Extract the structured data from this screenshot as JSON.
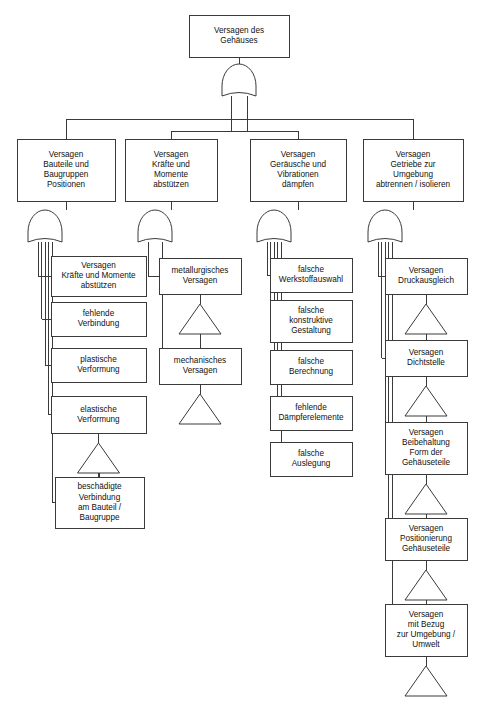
{
  "diagram": {
    "type": "fault-tree",
    "language": "de",
    "colors": {
      "stroke": "#3a3a3a",
      "fill": "#ffffff",
      "text": "#111111"
    },
    "gate_symbol": "or-gate",
    "transfer_symbol": "triangle"
  },
  "root": {
    "label": "Versagen des Gehäuses",
    "lines": [
      "Versagen des",
      "Gehäuses"
    ],
    "box": {
      "x": 189,
      "y": 15,
      "w": 100,
      "h": 42
    },
    "gate": {
      "cx": 239,
      "cy": 86
    }
  },
  "level2": [
    {
      "id": "col1-head",
      "label": "Versagen Bauteile und Baugruppen Positionen",
      "lines": [
        "Versagen",
        "Bauteile und",
        "Baugruppen",
        "Positionen"
      ],
      "box": {
        "x": 17,
        "y": 139,
        "w": 98,
        "h": 62
      },
      "gate": {
        "cx": 45,
        "cy": 232
      }
    },
    {
      "id": "col2-head",
      "label": "Versagen Kräfte und Momente abstützen",
      "lines": [
        "Versagen",
        "Kräfte und",
        "Momente",
        "abstützen"
      ],
      "box": {
        "x": 125,
        "y": 139,
        "w": 92,
        "h": 62
      },
      "gate": {
        "cx": 155,
        "cy": 232
      }
    },
    {
      "id": "col3-head",
      "label": "Versagen Geräusche und Vibrationen dämpfen",
      "lines": [
        "Versagen",
        "Geräusche und",
        "Vibrationen",
        "dämpfen"
      ],
      "box": {
        "x": 250,
        "y": 139,
        "w": 96,
        "h": 62
      },
      "gate": {
        "cx": 274,
        "cy": 232
      }
    },
    {
      "id": "col4-head",
      "label": "Versagen Getriebe zur Umgebung abtrennen / isolieren",
      "lines": [
        "Versagen",
        "Getriebe zur",
        "Umgebung",
        "abtrennen / isolieren"
      ],
      "box": {
        "x": 363,
        "y": 139,
        "w": 100,
        "h": 62
      },
      "gate": {
        "cx": 385,
        "cy": 232
      }
    }
  ],
  "column1": {
    "parent": "col1-head",
    "items": [
      {
        "label": "Versagen Kräfte und Momente abstützen",
        "lines": [
          "Versagen",
          "Kräfte und Momente",
          "abstützen"
        ],
        "box": {
          "x": 51,
          "y": 256,
          "w": 95,
          "h": 40
        },
        "triangle": false
      },
      {
        "label": "fehlende Verbindung",
        "lines": [
          "fehlende",
          "Verbindung"
        ],
        "box": {
          "x": 51,
          "y": 302,
          "w": 95,
          "h": 34
        },
        "triangle": false
      },
      {
        "label": "plastische Verformung",
        "lines": [
          "plastische",
          "Verformung"
        ],
        "box": {
          "x": 51,
          "y": 348,
          "w": 95,
          "h": 34
        },
        "triangle": false
      },
      {
        "label": "elastische Verformung",
        "lines": [
          "elastische",
          "Verformung"
        ],
        "box": {
          "x": 51,
          "y": 396,
          "w": 95,
          "h": 37
        },
        "triangle": true
      },
      {
        "label": "beschädigte Verbindung am Bauteil / Baugruppe",
        "lines": [
          "beschädigte",
          "Verbindung",
          "am Bauteil /",
          "Baugruppe"
        ],
        "box": {
          "x": 55,
          "y": 477,
          "w": 89,
          "h": 51
        },
        "triangle": false
      }
    ]
  },
  "column2": {
    "parent": "col2-head",
    "items": [
      {
        "label": "metallurgisches Versagen",
        "lines": [
          "metallurgisches",
          "Versagen"
        ],
        "box": {
          "x": 159,
          "y": 258,
          "w": 82,
          "h": 36
        },
        "triangle": true
      },
      {
        "label": "mechanisches Versagen",
        "lines": [
          "mechanisches",
          "Versagen"
        ],
        "box": {
          "x": 159,
          "y": 348,
          "w": 82,
          "h": 36
        },
        "triangle": true
      }
    ]
  },
  "column3": {
    "parent": "col3-head",
    "items": [
      {
        "label": "falsche Werkstoffauswahl",
        "lines": [
          "falsche",
          "Werkstoffauswahl"
        ],
        "box": {
          "x": 270,
          "y": 258,
          "w": 82,
          "h": 34
        },
        "triangle": false
      },
      {
        "label": "falsche konstruktive Gestaltung",
        "lines": [
          "falsche",
          "konstruktive",
          "Gestaltung"
        ],
        "box": {
          "x": 270,
          "y": 300,
          "w": 82,
          "h": 42
        },
        "triangle": false
      },
      {
        "label": "falsche Berechnung",
        "lines": [
          "falsche",
          "Berechnung"
        ],
        "box": {
          "x": 270,
          "y": 350,
          "w": 82,
          "h": 34
        },
        "triangle": false
      },
      {
        "label": "fehlende Dämpferelemente",
        "lines": [
          "fehlende",
          "Dämpferelemente"
        ],
        "box": {
          "x": 270,
          "y": 396,
          "w": 82,
          "h": 34
        },
        "triangle": false
      },
      {
        "label": "falsche Auslegung",
        "lines": [
          "falsche",
          "Auslegung"
        ],
        "box": {
          "x": 270,
          "y": 442,
          "w": 82,
          "h": 34
        },
        "triangle": false
      }
    ]
  },
  "column4": {
    "parent": "col4-head",
    "items": [
      {
        "label": "Versagen Druckausgleich",
        "lines": [
          "Versagen",
          "Druckausgleich"
        ],
        "box": {
          "x": 385,
          "y": 258,
          "w": 82,
          "h": 36
        },
        "triangle": true
      },
      {
        "label": "Versagen Dichtstelle",
        "lines": [
          "Versagen",
          "Dichtstelle"
        ],
        "box": {
          "x": 385,
          "y": 340,
          "w": 82,
          "h": 36
        },
        "triangle": true
      },
      {
        "label": "Versagen Beibehaltung Form der Gehäuseteile",
        "lines": [
          "Versagen",
          "Beibehaltung",
          "Form der",
          "Gehäuseteile"
        ],
        "box": {
          "x": 385,
          "y": 422,
          "w": 82,
          "h": 52
        },
        "triangle": true
      },
      {
        "label": "Versagen Positionierung Gehäuseteile",
        "lines": [
          "Versagen",
          "Positionierung",
          "Gehäuseteile"
        ],
        "box": {
          "x": 385,
          "y": 518,
          "w": 82,
          "h": 42
        },
        "triangle": true
      },
      {
        "label": "Versagen mit Bezug zur Umgebung / Umwelt",
        "lines": [
          "Versagen",
          "mit Bezug",
          "zur Umgebung /",
          "Umwelt"
        ],
        "box": {
          "x": 385,
          "y": 604,
          "w": 82,
          "h": 52
        },
        "triangle": true
      }
    ]
  },
  "watermark": {
    "text": ""
  }
}
